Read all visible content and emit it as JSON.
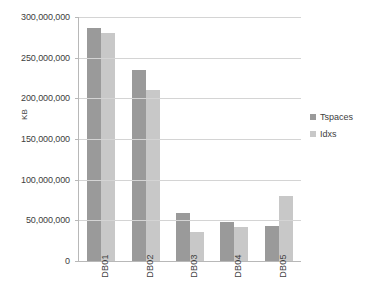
{
  "chart_data": {
    "type": "bar",
    "title": "",
    "subtitle": "",
    "xlabel": "",
    "ylabel": "KB",
    "categories": [
      "DB01",
      "DB02",
      "DB03",
      "DB04",
      "DB05"
    ],
    "series": [
      {
        "name": "Tspaces",
        "color": "#9a9a9a",
        "values": [
          287000000,
          235000000,
          59000000,
          48000000,
          43000000
        ]
      },
      {
        "name": "Idxs",
        "color": "#c8c8c8",
        "values": [
          280000000,
          210000000,
          36000000,
          42000000,
          80000000
        ]
      }
    ],
    "ylim": [
      0,
      300000000
    ],
    "ytick_values": [
      0,
      50000000,
      100000000,
      150000000,
      200000000,
      250000000,
      300000000
    ],
    "ytick_labels": [
      "0",
      "50,000,000",
      "100,000,000",
      "150,000,000",
      "200,000,000",
      "250,000,000",
      "300,000,000"
    ],
    "grid": "horizontal",
    "legend_position": "right",
    "xtick_label_rotation": 90,
    "bar_grouping": "clustered"
  }
}
